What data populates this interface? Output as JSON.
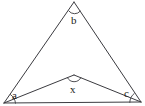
{
  "figure": {
    "background_color": "#ffffff",
    "stroke_color": "#3b3b40",
    "label_color": "#1d1d20",
    "width": 145,
    "height": 106,
    "labels": {
      "a": "a",
      "b": "b",
      "c": "c",
      "x": "x"
    },
    "vertices": [
      {
        "name": "a",
        "label": "a",
        "x": 4,
        "y": 103,
        "label_x": 12,
        "label_y": 99
      },
      {
        "name": "b",
        "label": "b",
        "x": 74,
        "y": 2,
        "label_x": 71,
        "label_y": 24
      },
      {
        "name": "c",
        "label": "c",
        "x": 141,
        "y": 102,
        "label_x": 124,
        "label_y": 97
      },
      {
        "name": "x",
        "label": "x",
        "x": 74,
        "y": 75,
        "label_x": 70,
        "label_y": 93
      }
    ],
    "segments": [
      {
        "name": "side-a-b",
        "from": "a",
        "to": "b"
      },
      {
        "name": "side-b-c",
        "from": "b",
        "to": "c"
      },
      {
        "name": "side-a-c",
        "from": "a",
        "to": "c"
      },
      {
        "name": "segment-a-x",
        "from": "a",
        "to": "x"
      },
      {
        "name": "segment-x-c",
        "from": "x",
        "to": "c"
      }
    ],
    "angle_marks": [
      {
        "name": "angle-arc-a",
        "at": "a"
      },
      {
        "name": "angle-arc-b",
        "at": "b"
      },
      {
        "name": "angle-arc-c",
        "at": "c"
      },
      {
        "name": "angle-arc-x",
        "at": "x"
      }
    ]
  }
}
